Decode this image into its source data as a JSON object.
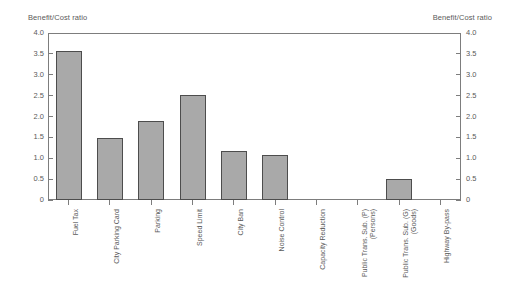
{
  "chart_data": {
    "type": "bar",
    "title": "",
    "xlabel": "",
    "ylabel": "Benefit/Cost ratio",
    "ylabel_right": "Benefit/Cost ratio",
    "ylim": [
      0,
      4.0
    ],
    "ytick_labels": [
      "4.0",
      "3.5",
      "3.0",
      "2.5",
      "2.0",
      "1.5",
      "1.0",
      "0.5",
      "0"
    ],
    "ytick_values": [
      4.0,
      3.5,
      3.0,
      2.5,
      2.0,
      1.5,
      1.0,
      0.5,
      0
    ],
    "grid": false,
    "legend": null,
    "categories": [
      "Fuel Tax",
      "City Parking Card",
      "Parking",
      "Speed Limit",
      "City Ban",
      "Noise Control",
      "Capacity Reduction",
      "Public Trans. Sub. (P) (Persons)",
      "Public Trans. Sub. (G) (Goods)",
      "Highway By-pass"
    ],
    "category_lines": [
      [
        "Fuel Tax"
      ],
      [
        "City Parking Card"
      ],
      [
        "Parking"
      ],
      [
        "Speed Limit"
      ],
      [
        "City Ban"
      ],
      [
        "Noise Control"
      ],
      [
        "Capacity Reduction"
      ],
      [
        "Public Trans. Sub. (P)",
        "(Persons)"
      ],
      [
        "Public Trans. Sub. (G)",
        "(Goods)"
      ],
      [
        "Highway By-pass"
      ]
    ],
    "values": [
      3.58,
      1.48,
      1.9,
      2.52,
      1.17,
      1.08,
      0,
      0,
      0.5,
      0
    ],
    "bar_color": "#a9a9a9",
    "bar_edge_color": "#4d4d4d",
    "axis_color": "#7d7d7d",
    "text_color": "#5a5a5a"
  }
}
